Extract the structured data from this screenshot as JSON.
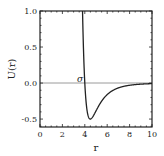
{
  "chart_data": {
    "type": "line",
    "title": "",
    "xlabel": "r",
    "ylabel": "U(r)",
    "xlim": [
      0,
      10
    ],
    "ylim": [
      -0.61,
      1.0
    ],
    "x_ticks": [
      0,
      2,
      4,
      6,
      8,
      10
    ],
    "x_tick_labels": [
      "0",
      "2",
      "4",
      "6",
      "8",
      "10"
    ],
    "y_ticks": [
      -0.5,
      0.0,
      0.5,
      1.0
    ],
    "y_tick_labels": [
      "-0.5",
      "0.0",
      "0.5",
      "1.0"
    ],
    "grid": false,
    "legend": null,
    "reference_line": {
      "y": 0.0,
      "color": "#999999"
    },
    "annotations": [
      {
        "text": "σ",
        "x": 3.6,
        "y": 0.03
      }
    ],
    "series": [
      {
        "name": "U(r)",
        "color": "#222222",
        "model": "Lennard-Jones",
        "params": {
          "sigma": 4.0,
          "epsilon": 0.5
        },
        "x": [
          3.8,
          3.9,
          4.0,
          4.1,
          4.2,
          4.3,
          4.4,
          4.5,
          4.6,
          4.8,
          5.0,
          5.5,
          6.0,
          6.5,
          7.0,
          8.0,
          9.0,
          10.0
        ],
        "values": [
          0.98,
          0.44,
          0.0,
          -0.26,
          -0.4,
          -0.47,
          -0.5,
          -0.5,
          -0.49,
          -0.45,
          -0.39,
          -0.27,
          -0.17,
          -0.11,
          -0.072,
          -0.031,
          -0.015,
          -0.008
        ]
      }
    ]
  },
  "labels": {
    "xlabel": "r",
    "ylabel": "U(r)",
    "sigma": "σ",
    "x_ticks": [
      "0",
      "2",
      "4",
      "6",
      "8",
      "10"
    ],
    "y_ticks": [
      "1.0",
      "0.5",
      "0.0",
      "-0.5"
    ]
  }
}
